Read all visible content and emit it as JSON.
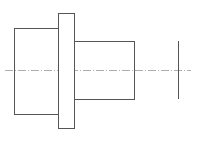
{
  "drawing": {
    "type": "stepped-shaft-side-view",
    "stroke_color": "#555555",
    "centerline_color": "#999999",
    "parts": [
      {
        "name": "left-cylinder",
        "x": 14,
        "y": 28,
        "w": 44,
        "h": 86
      },
      {
        "name": "flange",
        "x": 58,
        "y": 13,
        "w": 16,
        "h": 115
      },
      {
        "name": "right-cylinder",
        "x": 74,
        "y": 41,
        "w": 60,
        "h": 58
      }
    ],
    "end_line": {
      "x": 178,
      "y1": 41,
      "y2": 99
    },
    "centerline": {
      "y": 70,
      "x1": 5,
      "x2": 191
    }
  }
}
